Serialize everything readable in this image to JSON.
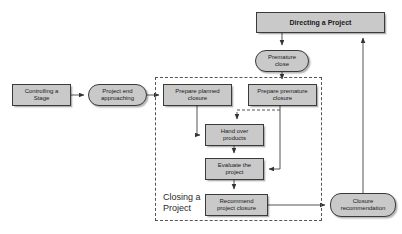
{
  "diagram": {
    "title_fragment": "",
    "group": {
      "label": "Closing a\nProject",
      "name": "closing-a-project-group"
    },
    "nodes": [
      {
        "id": "controlling-a-stage",
        "label": "Controlling a\nStage",
        "shape": "rect",
        "x": 12,
        "y": 84,
        "w": 59,
        "h": 22,
        "bold": false
      },
      {
        "id": "project-end-approaching",
        "label": "Project end\napproaching",
        "shape": "rounded",
        "x": 88,
        "y": 84,
        "w": 59,
        "h": 22,
        "bold": false
      },
      {
        "id": "directing-a-project",
        "label": "Directing a Project",
        "shape": "rect",
        "x": 256,
        "y": 12,
        "w": 129,
        "h": 21,
        "bold": true
      },
      {
        "id": "premature-close",
        "label": "Premature\nclose",
        "shape": "rounded",
        "x": 255,
        "y": 50,
        "w": 54,
        "h": 22,
        "bold": false
      },
      {
        "id": "prepare-planned-closure",
        "label": "Prepare planned\nclosure",
        "shape": "rect",
        "x": 163,
        "y": 84,
        "w": 69,
        "h": 22,
        "bold": false
      },
      {
        "id": "prepare-premature-closure",
        "label": "Prepare premature\nclosure",
        "shape": "rect",
        "x": 248,
        "y": 84,
        "w": 69,
        "h": 22,
        "bold": false
      },
      {
        "id": "hand-over-products",
        "label": "Hand over\nproducts",
        "shape": "rect",
        "x": 205,
        "y": 124,
        "w": 59,
        "h": 22,
        "bold": false
      },
      {
        "id": "evaluate-the-project",
        "label": "Evaluate the\nproject",
        "shape": "rect",
        "x": 205,
        "y": 158,
        "w": 59,
        "h": 22,
        "bold": false
      },
      {
        "id": "recommend-project-closure",
        "label": "Recommend\nproject closure",
        "shape": "rect",
        "x": 205,
        "y": 194,
        "w": 63,
        "h": 22,
        "bold": false
      },
      {
        "id": "closure-recommendation",
        "label": "Closure\nrecommendation",
        "shape": "rounded",
        "x": 330,
        "y": 193,
        "w": 66,
        "h": 24,
        "bold": false
      }
    ],
    "colors": {
      "node_fill": "#c9c9c9",
      "node_border": "#3a3a3a",
      "connector": "#555555",
      "group_border": "#555555",
      "background": "#ffffff",
      "text": "#1a1a1a"
    },
    "connectors": [
      {
        "name": "controlling-stage-to-project-end",
        "style": "solid"
      },
      {
        "name": "project-end-to-prepare-planned-closure",
        "style": "solid"
      },
      {
        "name": "directing-project-to-premature-close",
        "style": "solid"
      },
      {
        "name": "premature-close-to-prepare-premature",
        "style": "solid"
      },
      {
        "name": "prepare-planned-to-hand-over-products",
        "style": "solid"
      },
      {
        "name": "prepare-premature-to-hand-over-products",
        "style": "dashed"
      },
      {
        "name": "prepare-premature-to-evaluate-project",
        "style": "solid"
      },
      {
        "name": "hand-over-to-evaluate-project",
        "style": "solid"
      },
      {
        "name": "evaluate-to-recommend-project-closure",
        "style": "solid"
      },
      {
        "name": "recommend-closure-to-closure-recommendation",
        "style": "solid"
      },
      {
        "name": "closure-recommendation-to-directing-project",
        "style": "solid"
      }
    ]
  }
}
